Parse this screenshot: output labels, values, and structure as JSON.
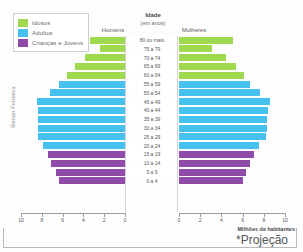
{
  "credit": "Renan Fonseca",
  "legend": {
    "items": [
      {
        "label": "Idosos",
        "color": "#9ed94f"
      },
      {
        "label": "Adultos",
        "color": "#45c0ef"
      },
      {
        "label": "Crianças e Jovens",
        "color": "#8e4ba8"
      }
    ]
  },
  "headers": {
    "idade": "Idade",
    "idade_sub": "(em anos)",
    "homens": "Homens",
    "mulheres": "Mulheres"
  },
  "axis_title": "Milhões de habitantes",
  "footnote": "*Projeção",
  "chart_data": {
    "type": "bar",
    "title": "Idade (em anos)",
    "subtype": "population-pyramid",
    "xlabel": "Milhões de habitantes",
    "ylabel": "Idade (em anos)",
    "xlim_left": [
      10,
      0
    ],
    "xlim_right": [
      0,
      10
    ],
    "grid": false,
    "legend_position": "top-left",
    "ticks_left": [
      "10",
      "8",
      "6",
      "4",
      "2",
      "0"
    ],
    "ticks_right": [
      "0",
      "2",
      "4",
      "6",
      "8",
      "10"
    ],
    "tick_values": [
      0,
      2,
      4,
      6,
      8,
      10
    ],
    "categories": [
      "80 ou mais",
      "75 a 79",
      "70 a 74",
      "65 a 69",
      "60 a 64",
      "55 a 59",
      "50 a 54",
      "45 a 49",
      "40 a 44",
      "35 a 39",
      "30 a 34",
      "25 a 29",
      "20 a 24",
      "15 a 19",
      "10 a 14",
      "5 a 9",
      "0 a 4"
    ],
    "group_colors": [
      "#9ed94f",
      "#45c0ef",
      "#8e4ba8"
    ],
    "category_groups": [
      "Idosos",
      "Idosos",
      "Idosos",
      "Idosos",
      "Idosos",
      "Adultos",
      "Adultos",
      "Adultos",
      "Adultos",
      "Adultos",
      "Adultos",
      "Adultos",
      "Adultos",
      "Crianças e Jovens",
      "Crianças e Jovens",
      "Crianças e Jovens",
      "Crianças e Jovens"
    ],
    "series": [
      {
        "name": "Homens",
        "side": "left",
        "values": [
          3.4,
          2.4,
          3.8,
          4.8,
          5.6,
          6.3,
          7.2,
          8.5,
          8.4,
          8.4,
          8.4,
          8.4,
          7.9,
          7.4,
          7.1,
          6.6,
          6.3
        ]
      },
      {
        "name": "Mulheres",
        "side": "right",
        "values": [
          5.1,
          3.1,
          4.4,
          5.4,
          6.1,
          6.7,
          7.6,
          8.6,
          8.4,
          8.3,
          8.3,
          8.2,
          7.5,
          7.1,
          6.7,
          6.3,
          6.0
        ]
      }
    ]
  }
}
